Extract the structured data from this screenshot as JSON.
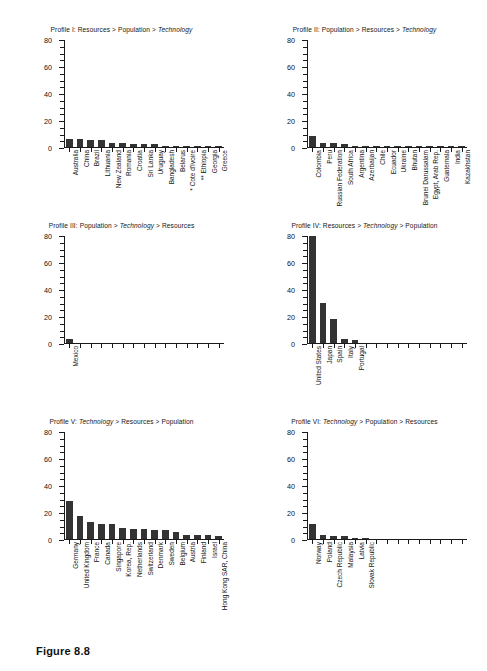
{
  "caption": "Figure 8.8",
  "axis": {
    "ylabel": "Number of CERTs",
    "yticks": [
      0,
      20,
      40,
      60,
      80
    ],
    "ymin": 0,
    "ymax": 80,
    "n_xticks": 15
  },
  "chart_data": [
    {
      "type": "bar",
      "panel": "I",
      "title": "Profile I: Resources > Population > Technology",
      "title_plain": "Profile I: Resources > Population > ",
      "title_italic": "Technology",
      "xlabel": "",
      "ylabel": "Number of CERTs",
      "ylim": [
        0,
        80
      ],
      "yticks": [
        0,
        20,
        40,
        60,
        80
      ],
      "grid": false,
      "legend": "none",
      "categories": [
        "Australia",
        "China",
        "Brazil",
        "Lithuania",
        "New Zealand",
        "Romania",
        "Croatia",
        "Sri Lanka",
        "Uruguay",
        "Bangladesh",
        "Belarus",
        "* Cote d'Ivoire",
        "** Ethiopia",
        "Georgia",
        "Greece"
      ],
      "values": [
        6,
        6,
        5,
        5,
        3,
        3,
        2,
        2,
        2,
        1,
        1,
        1,
        1,
        1,
        1
      ]
    },
    {
      "type": "bar",
      "panel": "II",
      "title": "Profile II: Population > Resources > Technology",
      "title_plain": "Profile II: Population > Resources > ",
      "title_italic": "Technology",
      "xlabel": "",
      "ylabel": "",
      "ylim": [
        0,
        80
      ],
      "yticks": [
        0,
        20,
        40,
        60,
        80
      ],
      "grid": false,
      "legend": "none",
      "categories": [
        "Colombia",
        "Peru",
        "Russian Federation",
        "South Africa",
        "Argentina",
        "Azerbaijan",
        "Chile",
        "Ecuador",
        "Ukraine",
        "Bhutan",
        "Brunei Darussalam",
        "Egypt, Arab Rep.",
        "Guatemala",
        "India",
        "Kazakhstan"
      ],
      "values": [
        8,
        3,
        3,
        2,
        1,
        1,
        1,
        1,
        1,
        1,
        1,
        1,
        1,
        1,
        1
      ]
    },
    {
      "type": "bar",
      "panel": "III",
      "title": "Profile III: Population > Technology > Resources",
      "title_plain_a": "Profile III: Population > ",
      "title_italic": "Technology",
      "title_plain_b": " > Resources",
      "xlabel": "",
      "ylabel": "Number of CERTs",
      "ylim": [
        0,
        80
      ],
      "yticks": [
        0,
        20,
        40,
        60,
        80
      ],
      "grid": false,
      "legend": "none",
      "categories": [
        "Mexico"
      ],
      "values": [
        3
      ]
    },
    {
      "type": "bar",
      "panel": "IV",
      "title": "Profile IV: Resources > Technology > Population",
      "title_plain_a": "Profile IV: Resources > ",
      "title_italic": "Technology",
      "title_plain_b": " > Population",
      "xlabel": "",
      "ylabel": "",
      "ylim": [
        0,
        80
      ],
      "yticks": [
        0,
        20,
        40,
        60,
        80
      ],
      "grid": false,
      "legend": "none",
      "categories": [
        "United States",
        "Japan",
        "Spain",
        "Italy",
        "Portugal"
      ],
      "values": [
        79,
        30,
        18,
        3,
        2
      ]
    },
    {
      "type": "bar",
      "panel": "V",
      "title": "Profile V: Technology > Resources > Population",
      "title_plain_a": "Profile V: ",
      "title_italic": "Technology",
      "title_plain_b": " > Resources > Population",
      "xlabel": "",
      "ylabel": "Number of CERTs",
      "ylim": [
        0,
        80
      ],
      "yticks": [
        0,
        20,
        40,
        60,
        80
      ],
      "grid": false,
      "legend": "none",
      "categories": [
        "Germany",
        "United Kingdom",
        "France",
        "Canada",
        "Singapore",
        "Korea, Rep.",
        "Netherlands",
        "Switzerland",
        "Denmark",
        "Sweden",
        "Belgium",
        "Austria",
        "Finland",
        "Israel",
        "Hong Kong SAR, China"
      ],
      "values": [
        28,
        17,
        12.5,
        11,
        11,
        8.5,
        7.5,
        7.5,
        6.5,
        6.5,
        5.5,
        3,
        3,
        3,
        2
      ]
    },
    {
      "type": "bar",
      "panel": "VI",
      "title": "Profile VI: Technology > Population > Resources",
      "title_plain_a": "Profile VI: ",
      "title_italic": "Technology",
      "title_plain_b": " > Population > Resources",
      "xlabel": "",
      "ylabel": "",
      "ylim": [
        0,
        80
      ],
      "yticks": [
        0,
        20,
        40,
        60,
        80
      ],
      "grid": false,
      "legend": "none",
      "categories": [
        "Norway",
        "Poland",
        "Czech Republic",
        "Malaysia",
        "Latvia",
        "Slovak Republic"
      ],
      "values": [
        11,
        3,
        2,
        2,
        1,
        1
      ]
    }
  ]
}
